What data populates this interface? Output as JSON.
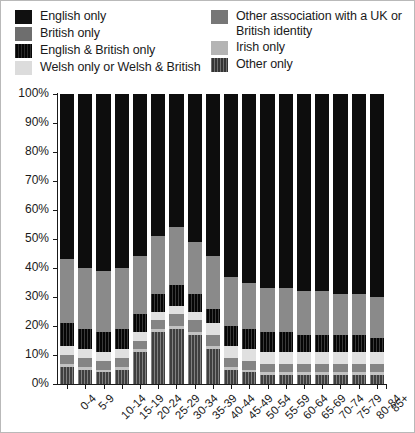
{
  "legend": {
    "columns": [
      {
        "items": [
          {
            "label": "English only",
            "swatch": "english-only",
            "color": "#101010"
          },
          {
            "label": "British only",
            "swatch": "british-only",
            "color": "#6e6e6e"
          },
          {
            "label": "English & British only",
            "swatch": "english-british",
            "color": "#111111"
          },
          {
            "label": "Welsh only or Welsh & British",
            "swatch": "welsh",
            "color": "#dcdcdc"
          }
        ]
      },
      {
        "items": [
          {
            "label": "Other association with a UK or\nBritish identity",
            "swatch": "other-assoc",
            "color": "#777777"
          },
          {
            "label": "Irish only",
            "swatch": "irish",
            "color": "#b4b4b4"
          },
          {
            "label": "Other only",
            "swatch": "other-only",
            "color": "#4a4a4a"
          }
        ]
      }
    ]
  },
  "axes": {
    "ytick_labels": [
      "100%",
      "90%",
      "80%",
      "70%",
      "60%",
      "50%",
      "40%",
      "30%",
      "20%",
      "10%",
      "0%"
    ],
    "ytick_values": [
      100,
      90,
      80,
      70,
      60,
      50,
      40,
      30,
      20,
      10,
      0
    ]
  },
  "chart_data": {
    "type": "bar",
    "stacked": true,
    "normalized": "100%",
    "title": "",
    "subtitle": "",
    "xlabel": "",
    "ylabel": "",
    "ylim": [
      0,
      100
    ],
    "grid": false,
    "legend_position": "top",
    "categories": [
      "0-4",
      "5-9",
      "10-14",
      "15-19",
      "20-24",
      "25-29",
      "30-34",
      "35-39",
      "40-44",
      "45-49",
      "50-54",
      "55-59",
      "60-64",
      "65-69",
      "70-74",
      "75-79",
      "80-84",
      "85+"
    ],
    "stack_order_bottom_to_top": [
      "Other only",
      "Irish only",
      "Other association with a UK or British identity",
      "Welsh only or Welsh & British",
      "English & British only",
      "British only",
      "English only"
    ],
    "series": [
      {
        "name": "Other only",
        "key": "other-only",
        "color": "#5b5b5b",
        "values": [
          6,
          5,
          4,
          5,
          11,
          18,
          19,
          17,
          12,
          5,
          4,
          3,
          3,
          3,
          3,
          3,
          3,
          3
        ]
      },
      {
        "name": "Irish only",
        "key": "irish",
        "color": "#c3c3c3",
        "values": [
          1,
          1,
          1,
          1,
          1,
          1,
          1,
          1,
          1,
          1,
          1,
          1,
          1,
          1,
          1,
          1,
          1,
          1
        ]
      },
      {
        "name": "Other association with a UK or British identity",
        "key": "other-assoc",
        "color": "#848484",
        "values": [
          3,
          3,
          3,
          3,
          3,
          3,
          4,
          4,
          4,
          3,
          3,
          3,
          3,
          3,
          3,
          3,
          3,
          3
        ]
      },
      {
        "name": "Welsh only or Welsh & British",
        "key": "welsh",
        "color": "#e0e0e0",
        "values": [
          3,
          3,
          3,
          3,
          3,
          3,
          3,
          3,
          4,
          4,
          4,
          4,
          4,
          4,
          4,
          4,
          4,
          4
        ]
      },
      {
        "name": "English & British only",
        "key": "english-british",
        "color": "#111111",
        "values": [
          8,
          7,
          7,
          7,
          6,
          6,
          7,
          6,
          5,
          7,
          7,
          7,
          7,
          6,
          6,
          6,
          6,
          5
        ]
      },
      {
        "name": "British only",
        "key": "british-only",
        "color": "#8a8a8a",
        "values": [
          22,
          21,
          21,
          21,
          20,
          20,
          20,
          18,
          18,
          17,
          16,
          15,
          15,
          15,
          15,
          14,
          14,
          14
        ]
      },
      {
        "name": "English only",
        "key": "english-only",
        "color": "#0d0d0d",
        "values": [
          57,
          60,
          61,
          60,
          56,
          49,
          46,
          51,
          56,
          63,
          65,
          67,
          67,
          68,
          68,
          69,
          69,
          70
        ]
      }
    ]
  }
}
